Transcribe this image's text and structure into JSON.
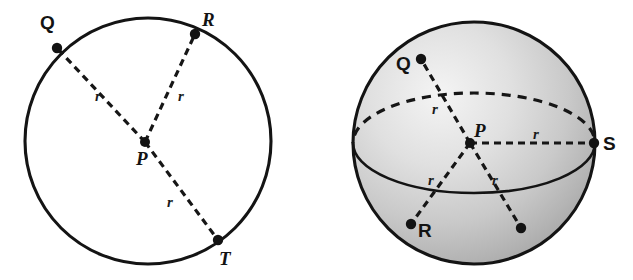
{
  "figure": {
    "background_color": "#ffffff",
    "ink_color": "#141414"
  },
  "circle_diagram": {
    "name": "circle-with-three-radii",
    "shape": "circle",
    "center_label": "P",
    "radius_symbol": "r",
    "point_labels": [
      "Q",
      "R",
      "T"
    ],
    "radii_labels": [
      "r",
      "r",
      "r"
    ],
    "labels": {
      "center": "P",
      "point_q": "Q",
      "point_r": "R",
      "point_t": "T",
      "radius_pq": "r",
      "radius_pr": "r",
      "radius_pt": "r"
    }
  },
  "sphere_diagram": {
    "name": "sphere-with-four-radii",
    "shape": "sphere",
    "center_label": "P",
    "radius_symbol": "r",
    "point_labels": [
      "Q",
      "S",
      "R",
      ""
    ],
    "radii_labels": [
      "r",
      "r",
      "r",
      "r"
    ],
    "labels": {
      "center": "P",
      "point_q": "Q",
      "point_s": "S",
      "point_r": "R",
      "radius_pq": "r",
      "radius_ps": "r",
      "radius_pr": "r",
      "radius_p_unlabeled": "r"
    },
    "shading": {
      "highlight_color": "#f2f2f2",
      "mid_color": "#d0d0d0",
      "shadow_color": "#a9a9a9"
    }
  }
}
